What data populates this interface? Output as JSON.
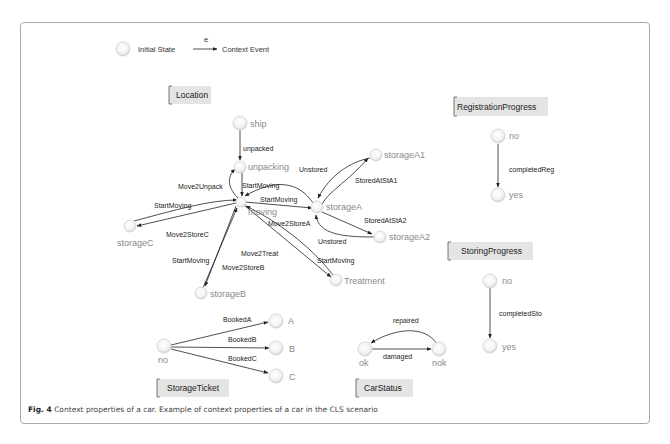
{
  "legend": {
    "initial_state": "Initial State",
    "event_symbol": "e",
    "context_event": "Context Event"
  },
  "groups": {
    "location": {
      "title": "Location",
      "states": [
        "ship",
        "unpacking",
        "moving",
        "storageA",
        "storageA1",
        "storageA2",
        "storageB",
        "storageC",
        "Treatment"
      ],
      "transitions": [
        {
          "from": "ship",
          "to": "unpacking",
          "label": "unpacked"
        },
        {
          "from": "moving",
          "to": "unpacking",
          "label": "Move2Unpack"
        },
        {
          "from": "unpacking",
          "to": "moving",
          "label": "StartMoving"
        },
        {
          "from": "storageA",
          "to": "moving",
          "label": "StartMoving"
        },
        {
          "from": "moving",
          "to": "storageA",
          "label": "Move2StoreA"
        },
        {
          "from": "storageA",
          "to": "storageA1",
          "label": "StoredAtStA1"
        },
        {
          "from": "storageA1",
          "to": "storageA",
          "label": "Unstored"
        },
        {
          "from": "storageA",
          "to": "storageA2",
          "label": "StoredAtStA2"
        },
        {
          "from": "storageA2",
          "to": "storageA",
          "label": "Unstored"
        },
        {
          "from": "storageC",
          "to": "moving",
          "label": "StartMoving"
        },
        {
          "from": "moving",
          "to": "storageC",
          "label": "Move2StoreC"
        },
        {
          "from": "storageB",
          "to": "moving",
          "label": "StartMoving"
        },
        {
          "from": "moving",
          "to": "storageB",
          "label": "Move2StoreB"
        },
        {
          "from": "moving",
          "to": "Treatment",
          "label": "Move2Treat"
        },
        {
          "from": "Treatment",
          "to": "moving",
          "label": "StartMoving"
        }
      ]
    },
    "registration": {
      "title": "RegistrationProgress",
      "states": [
        "no",
        "yes"
      ],
      "transition": "completedReg"
    },
    "storing": {
      "title": "StoringProgress",
      "states": [
        "no",
        "yes"
      ],
      "transition": "completedSto"
    },
    "ticket": {
      "title": "StorageTicket",
      "states": [
        "no",
        "A",
        "B",
        "C"
      ],
      "transitions": [
        "BookedA",
        "BookedB",
        "BookedC"
      ]
    },
    "carstatus": {
      "title": "CarStatus",
      "states": [
        "ok",
        "nok"
      ],
      "transitions": [
        "repaired",
        "damaged"
      ]
    }
  },
  "caption": {
    "fig": "Fig. 4",
    "text": " Context properties of a car. Example of context properties of a car in the CLS scenario"
  }
}
